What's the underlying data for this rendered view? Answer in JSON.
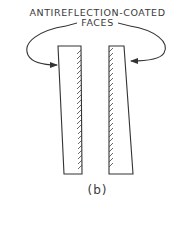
{
  "heading": {
    "line1": "ANTIREFLECTION-COATED",
    "line2": "FACES"
  },
  "caption": "(b)",
  "diagram": {
    "elements": [
      {
        "type": "plate",
        "name": "left-plate",
        "coated_face": "inner (right edge)"
      },
      {
        "type": "plate",
        "name": "right-plate",
        "coated_face": "inner (left edge)"
      },
      {
        "type": "arrow",
        "name": "left-arrow",
        "points_to": "left-plate outer face"
      },
      {
        "type": "arrow",
        "name": "right-arrow",
        "points_to": "right-plate outer face"
      }
    ],
    "stroke_color": "#333333",
    "background_color": "#ffffff"
  }
}
